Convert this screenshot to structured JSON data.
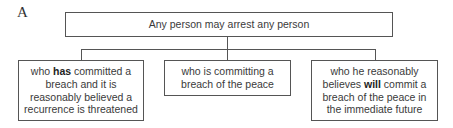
{
  "diagram": {
    "label": "A",
    "root": {
      "text": "Any person may arrest any person"
    },
    "children": [
      {
        "pre": "who ",
        "bold": "has",
        "post": " committed a breach and it is reasonably believed a recurrence is threatened"
      },
      {
        "pre": "who is committing a breach of the peace",
        "bold": "",
        "post": ""
      },
      {
        "pre": "who he reasonably believes ",
        "bold": "will",
        "post": " commit a breach of the peace in the immediate future"
      }
    ],
    "colors": {
      "line": "#555555",
      "text": "#3a3a3a"
    }
  }
}
